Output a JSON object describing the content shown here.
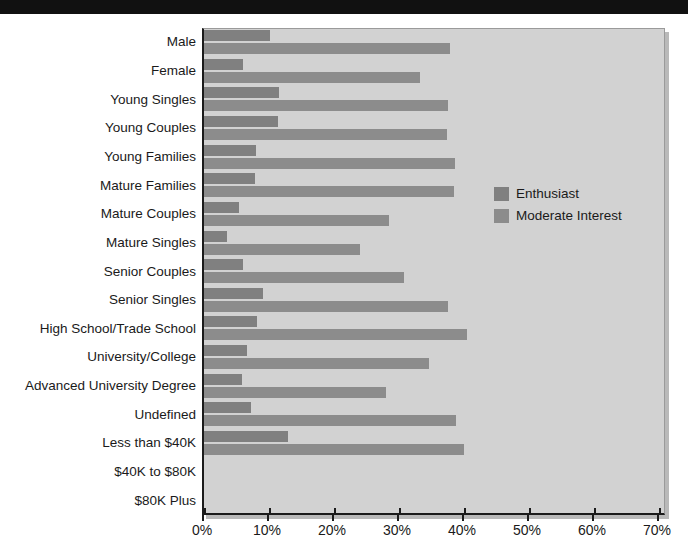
{
  "chart_data": {
    "type": "bar",
    "orientation": "horizontal",
    "title": "",
    "xlabel": "",
    "ylabel": "",
    "xlim": [
      0,
      70
    ],
    "xunit": "%",
    "grid": false,
    "legend_position": "inside-right",
    "xticks": [
      "0%",
      "10%",
      "20%",
      "30%",
      "40%",
      "50%",
      "60%",
      "70%"
    ],
    "xtick_values": [
      0,
      10,
      20,
      30,
      40,
      50,
      60,
      70
    ],
    "categories": [
      "Male",
      "Female",
      "Young Singles",
      "Young Couples",
      "Young Families",
      "Mature Families",
      "Mature Couples",
      "Mature Singles",
      "Senior Couples",
      "Senior Singles",
      "High School/Trade School",
      "University/College",
      "Advanced University Degree",
      "Undefined",
      "Less than $40K",
      "$40K to $80K",
      "$80K Plus"
    ],
    "series": [
      {
        "name": "Enthusiast",
        "color": "#808080",
        "values": [
          10.1,
          6.0,
          11.6,
          11.4,
          8.0,
          7.8,
          5.4,
          3.5,
          6.0,
          9.0,
          8.2,
          6.6,
          5.8,
          7.3,
          12.9,
          0,
          0
        ]
      },
      {
        "name": "Moderate Interest",
        "color": "#8c8c8c",
        "values": [
          37.8,
          33.2,
          37.5,
          37.4,
          38.6,
          38.4,
          28.4,
          24.0,
          30.8,
          37.5,
          40.4,
          34.6,
          28.0,
          38.8,
          40.0,
          0,
          0
        ]
      }
    ]
  },
  "legend": {
    "items": [
      {
        "label": "Enthusiast",
        "swatch": "enth"
      },
      {
        "label": "Moderate Interest",
        "swatch": "mod"
      }
    ]
  }
}
